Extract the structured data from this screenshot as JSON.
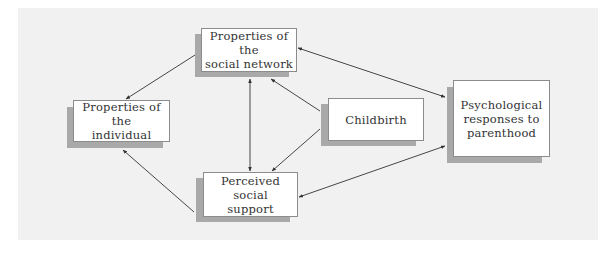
{
  "diagram": {
    "nodes": [
      {
        "id": "social-network",
        "label": "Properties of the\nsocial network",
        "box": {
          "x": 201,
          "y": 28,
          "w": 96,
          "h": 44
        },
        "shadow": {
          "x": 195,
          "y": 34,
          "w": 94,
          "h": 43
        }
      },
      {
        "id": "individual",
        "label": "Properties of the\nindividual",
        "box": {
          "x": 73,
          "y": 100,
          "w": 97,
          "h": 42
        },
        "shadow": {
          "x": 67,
          "y": 107,
          "w": 96,
          "h": 41
        }
      },
      {
        "id": "perceived-support",
        "label": "Perceived social\nsupport",
        "box": {
          "x": 203,
          "y": 172,
          "w": 95,
          "h": 45
        },
        "shadow": {
          "x": 196,
          "y": 178,
          "w": 94,
          "h": 44
        }
      },
      {
        "id": "childbirth",
        "label": "Childbirth",
        "box": {
          "x": 328,
          "y": 98,
          "w": 96,
          "h": 43
        },
        "shadow": {
          "x": 321,
          "y": 104,
          "w": 95,
          "h": 42
        }
      },
      {
        "id": "psych-responses",
        "label": "Psychological\nresponses to\nparenthood",
        "box": {
          "x": 453,
          "y": 80,
          "w": 97,
          "h": 77
        },
        "shadow": {
          "x": 447,
          "y": 87,
          "w": 95,
          "h": 76
        }
      }
    ],
    "edges": [
      {
        "from": "social-network",
        "to": "individual",
        "x1": 195,
        "y1": 55,
        "x2": 126,
        "y2": 99,
        "start_head": false,
        "end_head": true
      },
      {
        "from": "perceived-support",
        "to": "individual",
        "x1": 194,
        "y1": 212,
        "x2": 123,
        "y2": 150,
        "start_head": false,
        "end_head": true
      },
      {
        "from": "social-network",
        "to": "perceived-support",
        "x1": 250,
        "y1": 79,
        "x2": 250,
        "y2": 171,
        "start_head": true,
        "end_head": true
      },
      {
        "from": "childbirth",
        "to": "social-network",
        "x1": 320,
        "y1": 111,
        "x2": 271,
        "y2": 79,
        "start_head": false,
        "end_head": true
      },
      {
        "from": "childbirth",
        "to": "perceived-support",
        "x1": 320,
        "y1": 129,
        "x2": 272,
        "y2": 171,
        "start_head": false,
        "end_head": true
      },
      {
        "from": "social-network",
        "to": "psych-responses",
        "x1": 298,
        "y1": 48,
        "x2": 445,
        "y2": 97,
        "start_head": true,
        "end_head": true
      },
      {
        "from": "perceived-support",
        "to": "psych-responses",
        "x1": 299,
        "y1": 197,
        "x2": 445,
        "y2": 146,
        "start_head": true,
        "end_head": true
      }
    ],
    "colors": {
      "panel": "#f1f1f1",
      "box": "#ffffff",
      "shadow": "#a9a9a9",
      "border": "#8c8c8c",
      "arrow": "#333333",
      "text": "#333333"
    }
  }
}
